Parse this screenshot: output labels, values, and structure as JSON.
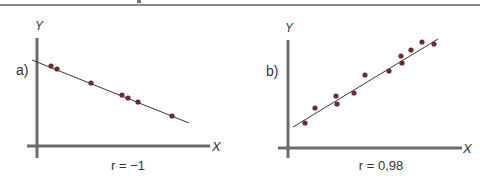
{
  "chart_data": [
    {
      "type": "scatter",
      "panel_label": "a)",
      "xlabel": "X",
      "ylabel": "Y",
      "caption": "r = −1",
      "correlation": -1,
      "grid": false,
      "trend_line": {
        "x1": 32,
        "y1": 60,
        "x2": 189,
        "y2": 123
      },
      "points": [
        {
          "x": 51,
          "y": 66
        },
        {
          "x": 57,
          "y": 69
        },
        {
          "x": 91,
          "y": 83
        },
        {
          "x": 122,
          "y": 95
        },
        {
          "x": 128,
          "y": 98
        },
        {
          "x": 138,
          "y": 102
        },
        {
          "x": 172,
          "y": 116
        }
      ]
    },
    {
      "type": "scatter",
      "panel_label": "b)",
      "xlabel": "X",
      "ylabel": "Y",
      "caption": "r = 0,98",
      "correlation": 0.98,
      "grid": false,
      "trend_line": {
        "x1": 293,
        "y1": 127,
        "x2": 438,
        "y2": 39
      },
      "points": [
        {
          "x": 305,
          "y": 123
        },
        {
          "x": 315,
          "y": 108
        },
        {
          "x": 336,
          "y": 96
        },
        {
          "x": 337,
          "y": 104
        },
        {
          "x": 354,
          "y": 93
        },
        {
          "x": 365,
          "y": 75
        },
        {
          "x": 389,
          "y": 71
        },
        {
          "x": 401,
          "y": 56
        },
        {
          "x": 402,
          "y": 63
        },
        {
          "x": 411,
          "y": 50
        },
        {
          "x": 422,
          "y": 42
        },
        {
          "x": 434,
          "y": 44
        }
      ]
    }
  ],
  "colors": {
    "axis": "#6b6b6b",
    "point": "#6e2a2f",
    "line": "#3a3a3a",
    "text": "#333333"
  }
}
